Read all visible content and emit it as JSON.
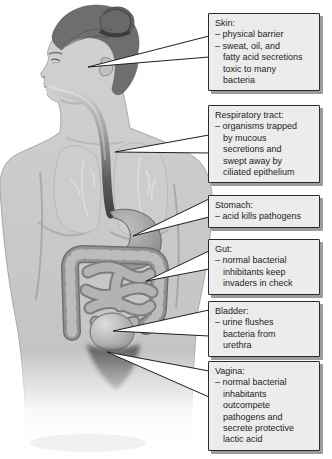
{
  "diagram": {
    "callouts": [
      {
        "id": "skin",
        "title": "Skin:",
        "lines": [
          "– physical barrier",
          "– sweat, oil, and",
          "fatty acid secretions",
          "toxic to many",
          "bacteria"
        ]
      },
      {
        "id": "respiratory-tract",
        "title": "Respiratory tract:",
        "lines": [
          "– organisms trapped",
          "by mucous",
          "secretions and",
          "swept away by",
          "ciliated epithelium"
        ]
      },
      {
        "id": "stomach",
        "title": "Stomach:",
        "lines": [
          "– acid kills pathogens"
        ]
      },
      {
        "id": "gut",
        "title": "Gut:",
        "lines": [
          "– normal bacterial",
          "inhibitants keep",
          "invaders in check"
        ]
      },
      {
        "id": "bladder",
        "title": "Bladder:",
        "lines": [
          "– urine flushes",
          "bacteria from",
          "urethra"
        ]
      },
      {
        "id": "vagina",
        "title": "Vagina:",
        "lines": [
          "– normal bacterial",
          "inhabitants",
          "outcompete",
          "pathogens and",
          "secrete protective",
          "lactic acid"
        ]
      }
    ],
    "colors": {
      "callout_bg": "#ececec",
      "callout_border": "#2b2b2b",
      "callout_shadow": "#9c9c9c",
      "text": "#1d1d1d",
      "pointer_fill": "#ffffff",
      "pointer_stroke": "#1f1f1f",
      "figure_body": "#c9c9c9",
      "figure_hair": "#6e6e6e"
    }
  }
}
